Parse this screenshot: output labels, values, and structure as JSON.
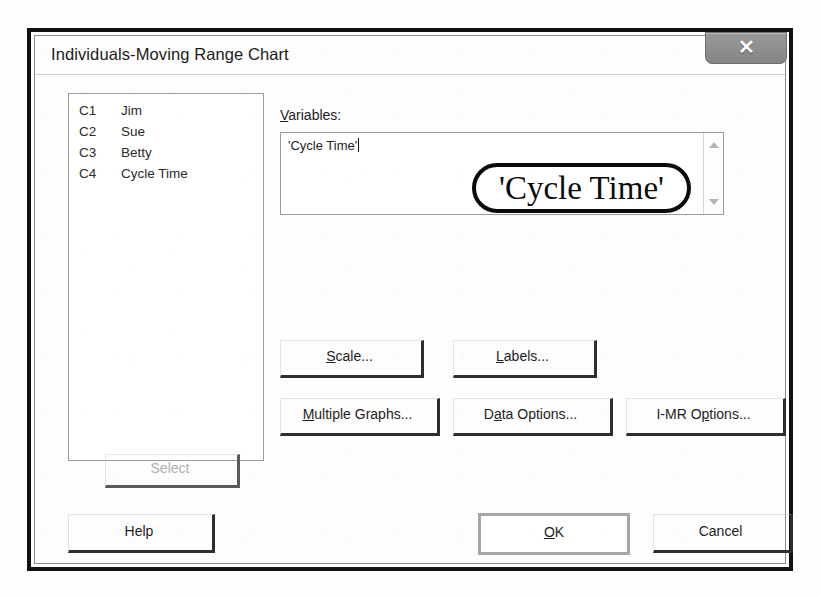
{
  "window": {
    "title": "Individuals-Moving Range Chart",
    "close_label": "✕",
    "close_icon": "close-icon"
  },
  "variable_list": {
    "rows": [
      {
        "column": "C1",
        "name": "Jim"
      },
      {
        "column": "C2",
        "name": "Sue"
      },
      {
        "column": "C3",
        "name": "Betty"
      },
      {
        "column": "C4",
        "name": "Cycle Time"
      }
    ]
  },
  "variables_field": {
    "label_accel": "V",
    "label_rest": "ariables:",
    "value": "'Cycle Time'",
    "scroll_up_icon": "triangle-up-icon",
    "scroll_down_icon": "triangle-down-icon"
  },
  "annotation": {
    "text": "'Cycle Time'"
  },
  "buttons": {
    "scale": {
      "accel": "S",
      "rest": "cale..."
    },
    "labels": {
      "accel": "L",
      "rest": "abels..."
    },
    "multiple_graphs": {
      "accel": "M",
      "rest": "ultiple Graphs..."
    },
    "data_options": {
      "pre": "D",
      "accel": "a",
      "rest": "ta Options..."
    },
    "imr_options": {
      "pre": "I-MR O",
      "accel": "p",
      "rest": "tions..."
    },
    "select": {
      "label": "Select",
      "disabled": true
    },
    "help": {
      "label": "Help"
    },
    "ok": {
      "accel": "O",
      "rest": "K"
    },
    "cancel": {
      "label": "Cancel"
    }
  },
  "colors": {
    "frame": "#111111",
    "text": "#1d1d1d",
    "disabled_text": "#b1b1b1",
    "button_shadow": "#2e2e2e",
    "default_ring": "#a6a6a6",
    "annotation": "#0b0b0b"
  }
}
